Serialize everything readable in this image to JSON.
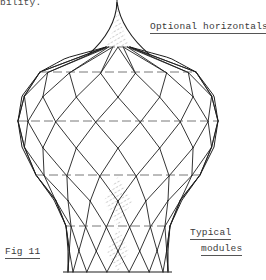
{
  "caption_fragment": "bility.",
  "labels": {
    "optional_horizontals": "Optional horizontals",
    "typical_line1": "Typical",
    "typical_line2": "modules",
    "figure": "Fig 11"
  },
  "drawing": {
    "subject": "onion-dome lattice shell of diamond modules",
    "stroke_color": "#1e1e1e",
    "dash_color": "#555555",
    "hatch_color": "#8a8a8a",
    "center_x": 118,
    "finial": {
      "tip": [
        117,
        2
      ],
      "base_y": 47,
      "base_half_width": 12
    },
    "profile": [
      [
        47,
        12
      ],
      [
        58,
        52
      ],
      [
        72,
        78
      ],
      [
        96,
        96
      ],
      [
        121,
        100
      ],
      [
        147,
        96
      ],
      [
        175,
        82
      ],
      [
        200,
        64
      ],
      [
        226,
        52
      ],
      [
        250,
        50
      ],
      [
        272,
        50
      ]
    ],
    "module_rings_y": [
      47,
      72,
      96,
      121,
      147,
      175,
      200,
      226,
      250,
      272
    ],
    "modules_per_ring": 14,
    "optional_horizontals_y": [
      47,
      72,
      121,
      175,
      226
    ],
    "ground_line": {
      "y": 272,
      "x1": 63,
      "x2": 172
    },
    "typical_modules_shaded": [
      {
        "ring_top": 5,
        "offset": 0
      },
      {
        "ring_top": 7,
        "offset": 0
      }
    ]
  }
}
